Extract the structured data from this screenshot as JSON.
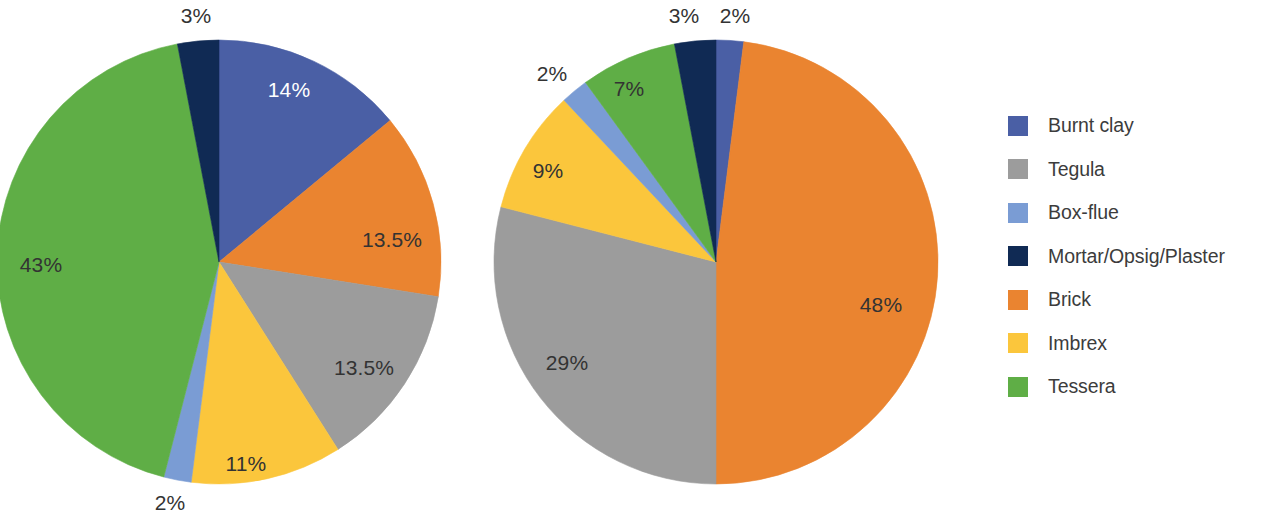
{
  "legend": {
    "position": "right",
    "items": [
      {
        "label": "Burnt clay",
        "color": "#4a5fa5"
      },
      {
        "label": "Tegula",
        "color": "#9c9c9c"
      },
      {
        "label": "Box-flue",
        "color": "#7a9cd4"
      },
      {
        "label": "Mortar/Opsig/Plaster",
        "color": "#102a54"
      },
      {
        "label": "Brick",
        "color": "#ea8430"
      },
      {
        "label": "Imbrex",
        "color": "#fbc63c"
      },
      {
        "label": "Tessera",
        "color": "#5fae46"
      }
    ]
  },
  "chart_data": [
    {
      "type": "pie",
      "title": "",
      "center": {
        "x": 219,
        "y": 262
      },
      "radius": 222,
      "start_angle": 0,
      "direction": "clockwise",
      "categories": [
        "Burnt clay",
        "Brick",
        "Tegula",
        "Imbrex",
        "Box-flue",
        "Tessera",
        "Mortar/Opsig/Plaster"
      ],
      "values": [
        14,
        13.5,
        13.5,
        11,
        2,
        43,
        3
      ],
      "colors": [
        "#4a5fa5",
        "#ea8430",
        "#9c9c9c",
        "#fbc63c",
        "#7a9cd4",
        "#5fae46",
        "#102a54"
      ],
      "labels": [
        "14%",
        "13.5%",
        "13.5%",
        "11%",
        "2%",
        "43%",
        "3%"
      ],
      "label_positions": [
        {
          "x": 289,
          "y": 89,
          "inside": true
        },
        {
          "x": 392,
          "y": 239,
          "inside": true
        },
        {
          "x": 364,
          "y": 367,
          "inside": true
        },
        {
          "x": 246,
          "y": 463,
          "inside": true
        },
        {
          "x": 170,
          "y": 502,
          "inside": false
        },
        {
          "x": 41,
          "y": 264,
          "inside": true
        },
        {
          "x": 196,
          "y": 15,
          "inside": false
        }
      ]
    },
    {
      "type": "pie",
      "title": "",
      "center": {
        "x": 716,
        "y": 262
      },
      "radius": 222,
      "start_angle": 0,
      "direction": "clockwise",
      "categories": [
        "Burnt clay",
        "Brick",
        "Tegula",
        "Imbrex",
        "Box-flue",
        "Tessera",
        "Mortar/Opsig/Plaster"
      ],
      "values": [
        2,
        48,
        29,
        9,
        2,
        7,
        3
      ],
      "colors": [
        "#4a5fa5",
        "#ea8430",
        "#9c9c9c",
        "#fbc63c",
        "#7a9cd4",
        "#5fae46",
        "#102a54"
      ],
      "labels": [
        "2%",
        "48%",
        "29%",
        "9%",
        "2%",
        "7%",
        "3%"
      ],
      "label_positions": [
        {
          "x": 735,
          "y": 15,
          "inside": false
        },
        {
          "x": 881,
          "y": 304,
          "inside": true
        },
        {
          "x": 567,
          "y": 362,
          "inside": true
        },
        {
          "x": 548,
          "y": 170,
          "inside": true
        },
        {
          "x": 552,
          "y": 73,
          "inside": false
        },
        {
          "x": 629,
          "y": 88,
          "inside": true
        },
        {
          "x": 684,
          "y": 15,
          "inside": false
        }
      ]
    }
  ]
}
